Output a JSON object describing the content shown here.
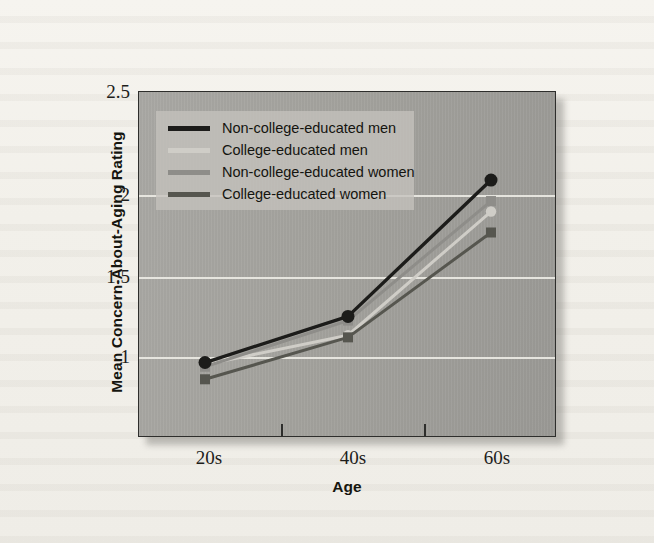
{
  "chart_data": {
    "type": "line",
    "title": "",
    "xlabel": "Age",
    "ylabel": "Mean Concern-About-Aging Rating",
    "categories": [
      "20s",
      "40s",
      "60s"
    ],
    "ylim": [
      0.85,
      2.5
    ],
    "yticks": [
      1,
      1.5,
      2,
      2.5
    ],
    "ytick_labels": [
      "1",
      "1.5",
      "2",
      "2.5"
    ],
    "grid": "horizontal",
    "legend_position": "upper-left-inside",
    "series": [
      {
        "name": "Non-college-educated men",
        "values": [
          1.21,
          1.43,
          2.08
        ],
        "color": "#1c1c1a",
        "marker": "circle"
      },
      {
        "name": "College-educated men",
        "values": [
          1.2,
          1.34,
          1.93
        ],
        "color": "#cfcdc7",
        "marker": "circle"
      },
      {
        "name": "Non-college-educated women",
        "values": [
          1.19,
          1.41,
          1.98
        ],
        "color": "#8e8d89",
        "marker": "square"
      },
      {
        "name": "College-educated women",
        "values": [
          1.13,
          1.33,
          1.83
        ],
        "color": "#56564f",
        "marker": "square"
      }
    ]
  },
  "legend": {
    "items": [
      {
        "label": "Non-college-educated men"
      },
      {
        "label": "College-educated men"
      },
      {
        "label": "Non-college-educated women"
      },
      {
        "label": "College-educated women"
      }
    ]
  },
  "axes": {
    "y_title": "Mean Concern-About-Aging Rating",
    "x_title": "Age",
    "y_ticks": [
      "2.5",
      "2",
      "1.5",
      "1"
    ],
    "x_ticks": [
      "20s",
      "40s",
      "60s"
    ]
  }
}
